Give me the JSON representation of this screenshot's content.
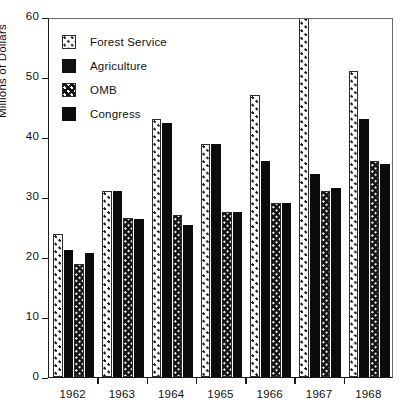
{
  "chart_data": {
    "type": "bar",
    "title": "",
    "xlabel": "",
    "ylabel": "Millions of Dollars",
    "ylim": [
      0,
      60
    ],
    "yticks": [
      0,
      10,
      20,
      30,
      40,
      50,
      60
    ],
    "grid": false,
    "legend_position": "top-left",
    "categories": [
      "1962",
      "1963",
      "1964",
      "1965",
      "1966",
      "1967",
      "1968"
    ],
    "series": [
      {
        "name": "Forest Service",
        "pattern": "dotted",
        "values": [
          23.8,
          31.0,
          43.0,
          38.8,
          47.0,
          61.5,
          51.0
        ]
      },
      {
        "name": "Agriculture",
        "pattern": "solid-black",
        "values": [
          21.2,
          31.0,
          42.3,
          38.8,
          36.0,
          33.8,
          43.0
        ]
      },
      {
        "name": "OMB",
        "pattern": "crosshatch",
        "values": [
          18.8,
          26.5,
          27.0,
          27.5,
          29.0,
          31.0,
          36.0
        ]
      },
      {
        "name": "Congress",
        "pattern": "solid-black",
        "values": [
          20.7,
          26.3,
          25.3,
          27.5,
          29.0,
          31.5,
          35.5
        ]
      }
    ]
  },
  "legend": {
    "items": [
      {
        "label": "Forest Service",
        "swatch": "dotted-swatch"
      },
      {
        "label": "Agriculture",
        "swatch": "black-swatch"
      },
      {
        "label": "OMB",
        "swatch": "crosshatch-swatch"
      },
      {
        "label": "Congress",
        "swatch": "black-swatch"
      }
    ]
  },
  "colors": {
    "ink": "#111111",
    "fill_black": "#0c0c0c",
    "background": "#ffffff",
    "axis": "#1a1a1a"
  }
}
